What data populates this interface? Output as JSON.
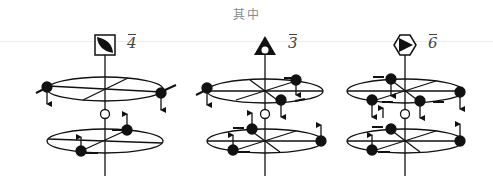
{
  "caption": "其中",
  "colors": {
    "ink": "#111111",
    "caption": "#8a8a8a",
    "label": "#444444",
    "rule": "#ececec"
  },
  "panels": [
    {
      "id": "rotoinversion-4bar",
      "symbol": "square-with-lens-icon",
      "label": "4",
      "overbar": true,
      "axis_x": 105
    },
    {
      "id": "rotoinversion-3bar",
      "symbol": "triangle-with-hole-icon",
      "label": "3",
      "overbar": true,
      "axis_x": 265
    },
    {
      "id": "rotoinversion-6bar",
      "symbol": "hexagon-with-triangle-icon",
      "label": "6",
      "overbar": true,
      "axis_x": 405
    }
  ]
}
